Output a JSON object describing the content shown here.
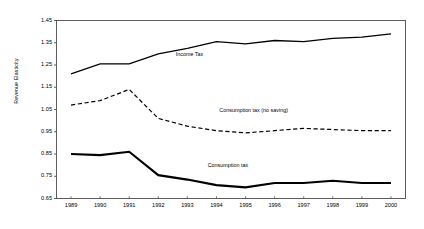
{
  "chart_data": {
    "type": "line",
    "title": "",
    "subtitle": "",
    "xlabel": "",
    "ylabel": "Revenue Elasticity",
    "grid": false,
    "legend_position": "inline-annotations",
    "x": [
      1989,
      1990,
      1991,
      1992,
      1993,
      1994,
      1995,
      1996,
      1997,
      1998,
      1999,
      2000
    ],
    "categories": [
      "1989",
      "1990",
      "1991",
      "1992",
      "1993",
      "1994",
      "1995",
      "1996",
      "1997",
      "1998",
      "1999",
      "2000"
    ],
    "xlim": [
      1988.5,
      2000.5
    ],
    "ylim": [
      0.65,
      1.45
    ],
    "yticks": [
      1.45,
      1.35,
      1.25,
      1.15,
      1.05,
      0.95,
      0.85,
      0.75,
      0.65
    ],
    "ytick_labels": [
      "1.45",
      "1.35",
      "1.25",
      "1.15",
      "1.05",
      "0.95",
      "0.85",
      "0.75",
      "0.65"
    ],
    "series": [
      {
        "name": "Income Tax",
        "style": "solid",
        "width": 1.3,
        "color": "#000000",
        "label_x": 1992.6,
        "label_y": 1.295,
        "values": [
          1.21,
          1.255,
          1.255,
          1.3,
          1.325,
          1.355,
          1.345,
          1.36,
          1.355,
          1.37,
          1.375,
          1.39
        ]
      },
      {
        "name": "Consumption tax (no saving)",
        "style": "dashed",
        "width": 1.2,
        "color": "#000000",
        "label_x": 1994.1,
        "label_y": 1.042,
        "values": [
          1.07,
          1.09,
          1.14,
          1.01,
          0.975,
          0.955,
          0.945,
          0.955,
          0.965,
          0.96,
          0.955,
          0.955
        ]
      },
      {
        "name": "Consumption tax",
        "style": "solid",
        "width": 2.1,
        "color": "#000000",
        "label_x": 1993.7,
        "label_y": 0.795,
        "values": [
          0.85,
          0.845,
          0.86,
          0.755,
          0.735,
          0.71,
          0.7,
          0.72,
          0.72,
          0.73,
          0.72,
          0.72
        ]
      }
    ]
  },
  "axes": {
    "frame_color": "#4d4d4d",
    "tick_color": "#4d4d4d"
  }
}
